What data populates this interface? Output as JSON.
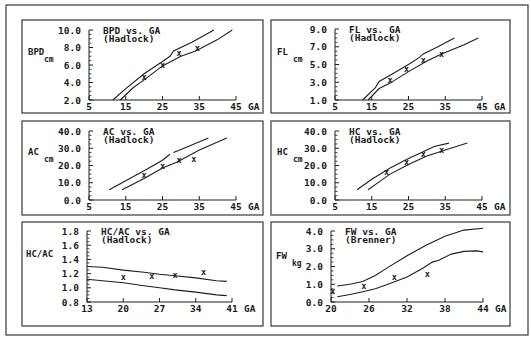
{
  "colors": {
    "ink": "#1e1e1e",
    "background": "#ffffff",
    "frame": "#3a3a3a"
  },
  "chart_data": [
    {
      "type": "line",
      "id": "bpd",
      "title": "BPD vs. GA",
      "subtitle": "(Hadlock)",
      "ylabel": "BPD",
      "yunit": "cm",
      "xlabel": "GA",
      "xticks": [
        5,
        15,
        25,
        35,
        45
      ],
      "yticks": [
        "2.0",
        "4.0",
        "6.0",
        "8.0",
        "10.0"
      ],
      "xlim": [
        5,
        45
      ],
      "ylim": [
        2,
        10
      ],
      "series": [
        {
          "name": "upper",
          "points": [
            [
              11.5,
              2.0
            ],
            [
              15,
              3.3
            ],
            [
              20,
              5.0
            ],
            [
              25,
              6.4
            ],
            [
              27,
              7.0
            ],
            [
              28,
              7.6
            ],
            [
              33,
              8.6
            ],
            [
              39,
              10.0
            ]
          ]
        },
        {
          "name": "lower",
          "points": [
            [
              13.5,
              2.0
            ],
            [
              17,
              3.4
            ],
            [
              20,
              4.3
            ],
            [
              25,
              5.9
            ],
            [
              30,
              7.0
            ],
            [
              34,
              7.6
            ],
            [
              40,
              8.9
            ],
            [
              44,
              10.0
            ]
          ]
        }
      ],
      "markers": [
        [
          20,
          4.6
        ],
        [
          25,
          6.0
        ],
        [
          29.5,
          7.4
        ],
        [
          34.5,
          8.0
        ]
      ]
    },
    {
      "type": "line",
      "id": "fl",
      "title": "FL vs. GA",
      "subtitle": "(Hadlock)",
      "ylabel": "FL",
      "yunit": "cm",
      "xlabel": "GA",
      "xticks": [
        5,
        15,
        25,
        35,
        45
      ],
      "yticks": [
        "1.0",
        "3.0",
        "5.0",
        "7.0",
        "9.0"
      ],
      "xlim": [
        5,
        45
      ],
      "ylim": [
        1,
        9
      ],
      "series": [
        {
          "name": "upper",
          "points": [
            [
              12.5,
              1.0
            ],
            [
              16,
              2.4
            ],
            [
              17,
              3.1
            ],
            [
              20,
              3.8
            ],
            [
              25,
              5.0
            ],
            [
              28,
              5.8
            ],
            [
              29,
              6.2
            ],
            [
              33,
              7.0
            ],
            [
              37.5,
              8.0
            ]
          ]
        },
        {
          "name": "lower",
          "points": [
            [
              14,
              1.0
            ],
            [
              17,
              2.3
            ],
            [
              20,
              2.9
            ],
            [
              25,
              4.2
            ],
            [
              30,
              5.4
            ],
            [
              34,
              6.2
            ],
            [
              40,
              7.2
            ],
            [
              44,
              8.0
            ]
          ]
        }
      ],
      "markers": [
        [
          20,
          3.3
        ],
        [
          24.5,
          4.5
        ],
        [
          29,
          5.5
        ],
        [
          34,
          6.2
        ]
      ]
    },
    {
      "type": "line",
      "id": "ac",
      "title": "AC vs. GA",
      "subtitle": "(Hadlock)",
      "ylabel": "AC",
      "yunit": "cm",
      "xlabel": "GA",
      "xticks": [
        5,
        15,
        25,
        35,
        45
      ],
      "yticks": [
        "0.0",
        "10.0",
        "20.0",
        "30.0",
        "40.0"
      ],
      "xlim": [
        5,
        45
      ],
      "ylim": [
        0,
        40
      ],
      "series": [
        {
          "name": "upper-a",
          "points": [
            [
              10.5,
              6.0
            ],
            [
              20,
              17.0
            ],
            [
              25,
              23.0
            ],
            [
              27,
              26.5
            ]
          ]
        },
        {
          "name": "upper-b",
          "points": [
            [
              28,
              27.5
            ],
            [
              32,
              31.0
            ],
            [
              37.5,
              36.0
            ]
          ]
        },
        {
          "name": "lower",
          "points": [
            [
              14,
              6.0
            ],
            [
              20,
              12.5
            ],
            [
              25,
              18.5
            ],
            [
              29,
              22.0
            ],
            [
              35,
              29.0
            ],
            [
              42.5,
              36.0
            ]
          ]
        }
      ],
      "markers": [
        [
          20,
          14.5
        ],
        [
          25,
          20.0
        ],
        [
          29.5,
          23.0
        ],
        [
          33.5,
          24.0
        ]
      ]
    },
    {
      "type": "line",
      "id": "hc",
      "title": "HC vs. GA",
      "subtitle": "(Hadlock)",
      "ylabel": "HC",
      "yunit": "cm",
      "xlabel": "GA",
      "xticks": [
        5,
        15,
        25,
        35,
        45
      ],
      "yticks": [
        "0.0",
        "10.0",
        "20.0",
        "30.0",
        "40.0"
      ],
      "xlim": [
        5,
        45
      ],
      "ylim": [
        0,
        40
      ],
      "series": [
        {
          "name": "upper",
          "points": [
            [
              11,
              6.0
            ],
            [
              15,
              12.0
            ],
            [
              20,
              18.5
            ],
            [
              25,
              24.0
            ],
            [
              29,
              28.0
            ],
            [
              32,
              31.0
            ],
            [
              36,
              33.0
            ]
          ]
        },
        {
          "name": "lower",
          "points": [
            [
              14,
              6.0
            ],
            [
              17,
              10.5
            ],
            [
              20,
              15.0
            ],
            [
              25,
              20.5
            ],
            [
              30,
              25.5
            ],
            [
              35,
              29.0
            ],
            [
              41,
              33.0
            ]
          ]
        }
      ],
      "markers": [
        [
          19,
          16.0
        ],
        [
          24.5,
          22.0
        ],
        [
          29,
          26.5
        ],
        [
          34,
          29.0
        ]
      ]
    },
    {
      "type": "line",
      "id": "hcac",
      "title": "HC/AC vs. GA",
      "subtitle": "(Hadlock)",
      "ylabel": "HC/AC",
      "yunit": "",
      "xlabel": "GA",
      "xticks": [
        13,
        20,
        27,
        34,
        41
      ],
      "yticks": [
        "0.8",
        "1.0",
        "1.2",
        "1.4",
        "1.6",
        "1.8"
      ],
      "ytick_values": [
        0.8,
        1.0,
        1.2,
        1.4,
        1.6,
        1.8
      ],
      "xlim": [
        13,
        41
      ],
      "ylim": [
        0.8,
        1.8
      ],
      "series": [
        {
          "name": "upper",
          "points": [
            [
              13,
              1.3
            ],
            [
              16,
              1.29
            ],
            [
              20,
              1.25
            ],
            [
              24,
              1.22
            ],
            [
              27,
              1.19
            ],
            [
              30,
              1.17
            ],
            [
              34,
              1.14
            ],
            [
              38,
              1.1
            ],
            [
              40,
              1.09
            ]
          ]
        },
        {
          "name": "lower",
          "points": [
            [
              13,
              1.12
            ],
            [
              16,
              1.1
            ],
            [
              20,
              1.07
            ],
            [
              24,
              1.03
            ],
            [
              27,
              1.0
            ],
            [
              30,
              0.97
            ],
            [
              34,
              0.94
            ],
            [
              38,
              0.9
            ],
            [
              40,
              0.89
            ]
          ]
        }
      ],
      "markers": [
        [
          20,
          1.15
        ],
        [
          25.5,
          1.17
        ],
        [
          30,
          1.18
        ],
        [
          35.5,
          1.22
        ]
      ]
    },
    {
      "type": "line",
      "id": "fw",
      "title": "FW vs. GA",
      "subtitle": "(Brenner)",
      "ylabel": "FW",
      "yunit": "kg",
      "xlabel": "GA",
      "xticks": [
        20,
        26,
        32,
        38,
        44
      ],
      "yticks": [
        "0.0",
        "1.0",
        "2.0",
        "3.0",
        "4.0"
      ],
      "ytick_values": [
        0,
        1,
        2,
        3,
        4
      ],
      "xlim": [
        20,
        44
      ],
      "ylim": [
        0,
        4.2
      ],
      "series": [
        {
          "name": "upper",
          "points": [
            [
              21,
              0.9
            ],
            [
              23,
              1.0
            ],
            [
              25,
              1.15
            ],
            [
              27,
              1.5
            ],
            [
              29,
              1.95
            ],
            [
              32,
              2.6
            ],
            [
              35,
              3.2
            ],
            [
              38,
              3.7
            ],
            [
              41,
              4.05
            ],
            [
              44,
              4.15
            ]
          ]
        },
        {
          "name": "lower",
          "points": [
            [
              21,
              0.3
            ],
            [
              23,
              0.42
            ],
            [
              25,
              0.58
            ],
            [
              27,
              0.75
            ],
            [
              29,
              1.0
            ],
            [
              32,
              1.4
            ],
            [
              34.5,
              1.9
            ],
            [
              36,
              2.25
            ],
            [
              37,
              2.35
            ],
            [
              39,
              2.7
            ],
            [
              41,
              2.85
            ],
            [
              43,
              2.88
            ],
            [
              44,
              2.82
            ]
          ]
        }
      ],
      "markers": [
        [
          20.3,
          0.6
        ],
        [
          25.2,
          0.9
        ],
        [
          30,
          1.4
        ],
        [
          35.2,
          1.6
        ]
      ]
    }
  ]
}
